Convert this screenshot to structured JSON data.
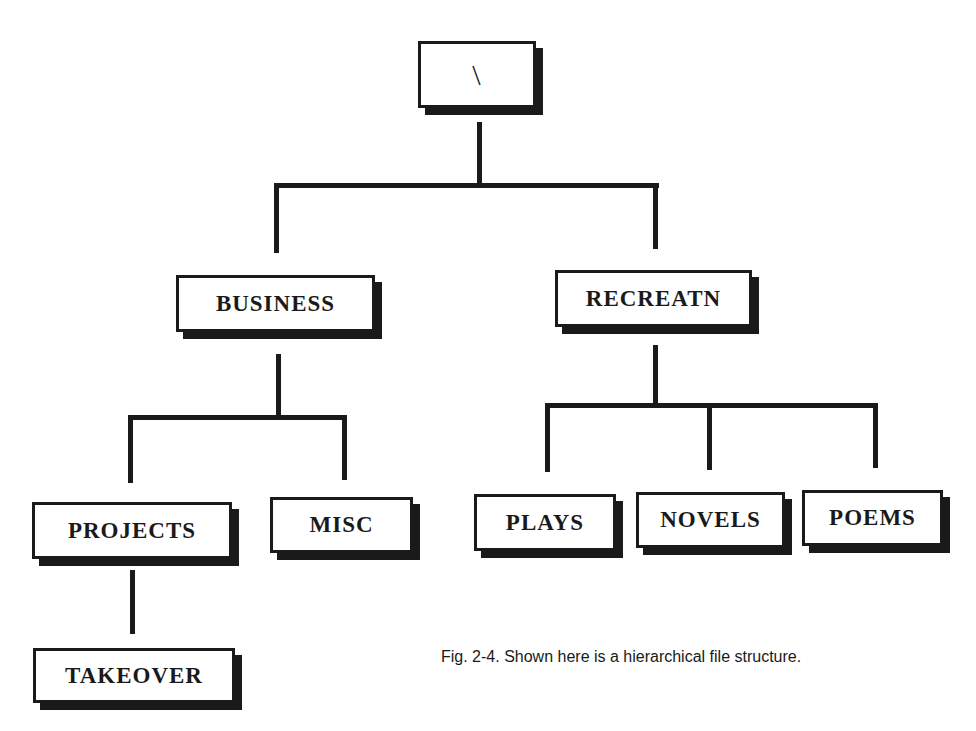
{
  "diagram": {
    "type": "tree",
    "root": {
      "label": "\\",
      "children": [
        {
          "label": "BUSINESS",
          "children": [
            {
              "label": "PROJECTS",
              "children": [
                {
                  "label": "TAKEOVER"
                }
              ]
            },
            {
              "label": "MISC"
            }
          ]
        },
        {
          "label": "RECREATN",
          "children": [
            {
              "label": "PLAYS"
            },
            {
              "label": "NOVELS"
            },
            {
              "label": "POEMS"
            }
          ]
        }
      ]
    },
    "nodes": {
      "root": "\\",
      "business": "BUSINESS",
      "recreatn": "RECREATN",
      "projects": "PROJECTS",
      "misc": "MISC",
      "plays": "PLAYS",
      "novels": "NOVELS",
      "poems": "POEMS",
      "takeover": "TAKEOVER"
    },
    "caption": "Fig. 2-4. Shown here is a hierarchical file structure."
  },
  "colors": {
    "ink": "#1a1a1a",
    "background": "#ffffff"
  }
}
